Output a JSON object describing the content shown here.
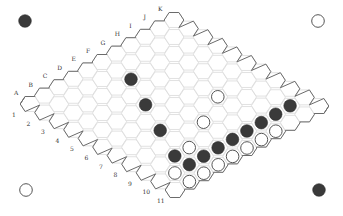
{
  "game": {
    "name": "Hex",
    "board_size": 11,
    "column_labels": [
      "A",
      "B",
      "C",
      "D",
      "E",
      "F",
      "G",
      "H",
      "I",
      "J",
      "K"
    ],
    "row_labels": [
      "1",
      "2",
      "3",
      "4",
      "5",
      "6",
      "7",
      "8",
      "9",
      "10",
      "11"
    ]
  },
  "colors": {
    "black_stone": "#3a3a3a",
    "white_stone": "#ffffff",
    "grid": "#d9d9d9",
    "edge": "#6b6b6b"
  },
  "corner_markers": [
    {
      "position": "top-left",
      "color": "black"
    },
    {
      "position": "top-right",
      "color": "white"
    },
    {
      "position": "bottom-left",
      "color": "white"
    },
    {
      "position": "bottom-right",
      "color": "black"
    }
  ],
  "stones": [
    {
      "cell": "F3",
      "col": 5,
      "row": 2,
      "color": "black"
    },
    {
      "cell": "E5",
      "col": 4,
      "row": 4,
      "color": "black"
    },
    {
      "cell": "D7",
      "col": 3,
      "row": 6,
      "color": "black"
    },
    {
      "cell": "C9",
      "col": 2,
      "row": 8,
      "color": "black"
    },
    {
      "cell": "C10",
      "col": 2,
      "row": 9,
      "color": "black"
    },
    {
      "cell": "D10",
      "col": 3,
      "row": 9,
      "color": "black"
    },
    {
      "cell": "E10",
      "col": 4,
      "row": 9,
      "color": "black"
    },
    {
      "cell": "F10",
      "col": 5,
      "row": 9,
      "color": "black"
    },
    {
      "cell": "G10",
      "col": 6,
      "row": 9,
      "color": "black"
    },
    {
      "cell": "H10",
      "col": 7,
      "row": 9,
      "color": "black"
    },
    {
      "cell": "I10",
      "col": 8,
      "row": 9,
      "color": "black"
    },
    {
      "cell": "J10",
      "col": 9,
      "row": 9,
      "color": "black"
    },
    {
      "cell": "H7",
      "col": 7,
      "row": 6,
      "color": "white"
    },
    {
      "cell": "F8",
      "col": 5,
      "row": 7,
      "color": "white"
    },
    {
      "cell": "D9",
      "col": 3,
      "row": 8,
      "color": "white"
    },
    {
      "cell": "B10",
      "col": 1,
      "row": 9,
      "color": "white"
    },
    {
      "cell": "B11",
      "col": 1,
      "row": 10,
      "color": "white"
    },
    {
      "cell": "C11",
      "col": 2,
      "row": 10,
      "color": "white"
    },
    {
      "cell": "D11",
      "col": 3,
      "row": 10,
      "color": "white"
    },
    {
      "cell": "E11",
      "col": 4,
      "row": 10,
      "color": "white"
    },
    {
      "cell": "F11",
      "col": 5,
      "row": 10,
      "color": "white"
    },
    {
      "cell": "G11",
      "col": 6,
      "row": 10,
      "color": "white"
    },
    {
      "cell": "H11",
      "col": 7,
      "row": 10,
      "color": "white"
    }
  ]
}
